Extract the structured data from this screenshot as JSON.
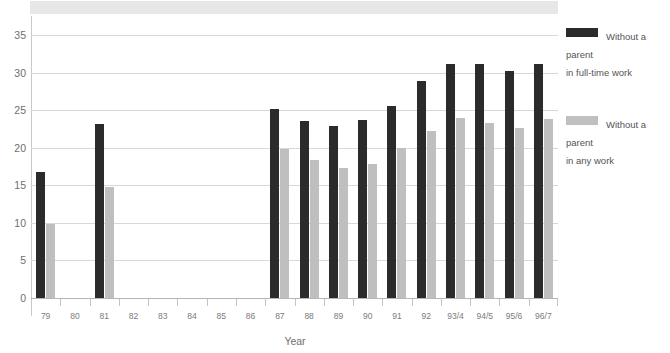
{
  "chart_data": {
    "type": "bar",
    "title": "",
    "xlabel": "Year",
    "ylabel": "",
    "ylim": [
      0,
      37
    ],
    "yticks": [
      0,
      5,
      10,
      15,
      20,
      25,
      30,
      35
    ],
    "grid": true,
    "legend_position": "right",
    "categories": [
      "79",
      "80",
      "81",
      "82",
      "83",
      "84",
      "85",
      "86",
      "87",
      "88",
      "89",
      "90",
      "91",
      "92",
      "93/4",
      "94/5",
      "95/6",
      "96/7"
    ],
    "series": [
      {
        "name": "Without a parent\nin full-time work",
        "color": "#2b2b2b",
        "values": [
          16.8,
          null,
          23.1,
          null,
          null,
          null,
          null,
          null,
          25.1,
          23.6,
          22.9,
          23.7,
          25.6,
          28.9,
          31.1,
          31.1,
          30.2,
          31.1
        ]
      },
      {
        "name": "Without a parent\nin any work",
        "color": "#bfbfbf",
        "values": [
          9.9,
          null,
          14.8,
          null,
          null,
          null,
          null,
          null,
          19.8,
          18.4,
          17.3,
          17.8,
          19.9,
          22.2,
          23.9,
          23.3,
          22.6,
          23.8
        ]
      }
    ]
  },
  "legend": {
    "items": [
      {
        "label": "Without a parent\nin full-time work",
        "swatch": "dark"
      },
      {
        "label": "Without a parent\nin any work",
        "swatch": "light"
      }
    ]
  },
  "axis": {
    "x_title": "Year"
  }
}
